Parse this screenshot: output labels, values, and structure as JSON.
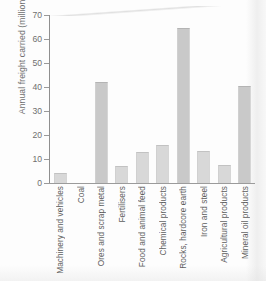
{
  "chart_data": {
    "type": "bar",
    "title": "",
    "xlabel": "",
    "ylabel": "Annual freight carried (million tonnes)",
    "ylim": [
      0,
      70
    ],
    "yticks": [
      0,
      10,
      20,
      30,
      40,
      50,
      60,
      70
    ],
    "grid": false,
    "legend": null,
    "categories": [
      "Machinery and vehicles",
      "Coal",
      "Ores and scrap metal",
      "Fertilisers",
      "Food and animal feed",
      "Chemical products",
      "Rocks, hardcore earth",
      "Iron and steel",
      "Agricultural products",
      "Mineral oil products"
    ],
    "values": [
      4,
      0,
      42,
      7,
      13,
      16,
      64.5,
      13.5,
      7.5,
      40.5
    ],
    "bar_color": "#d8d8d8",
    "accent_color": "#c9c9c9",
    "axis_color": "#9a9a9a",
    "text_color": "#6f6f6f"
  }
}
